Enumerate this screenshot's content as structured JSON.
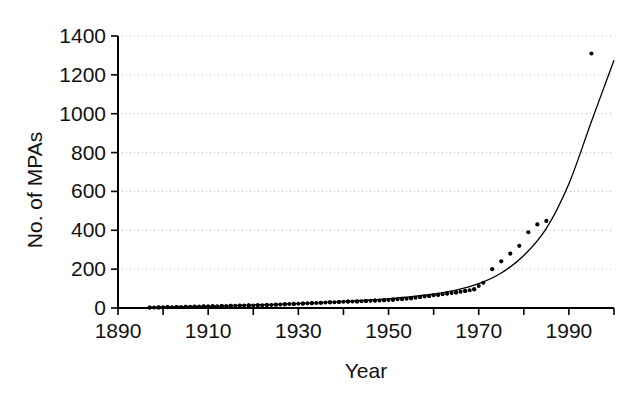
{
  "chart_data": {
    "type": "scatter",
    "title": "",
    "xlabel": "Year",
    "ylabel": "No. of MPAs",
    "xlim": [
      1890,
      2000
    ],
    "ylim": [
      0,
      1400
    ],
    "xticks": [
      1890,
      1900,
      1910,
      1920,
      1930,
      1940,
      1950,
      1960,
      1970,
      1980,
      1990,
      2000
    ],
    "xtick_labels": [
      "1890",
      "",
      "1910",
      "",
      "1930",
      "",
      "1950",
      "",
      "1970",
      "",
      "1990",
      ""
    ],
    "xtick_labels_shown": [
      "1890",
      "1910",
      "1930",
      "1950",
      "1970",
      "1990"
    ],
    "yticks": [
      0,
      200,
      400,
      600,
      800,
      1000,
      1200,
      1400
    ],
    "ytick_labels": [
      "0",
      "200",
      "400",
      "600",
      "800",
      "1000",
      "1200",
      "1400"
    ],
    "grid": "horizontal-dotted",
    "legend": null,
    "series": [
      {
        "name": "Cumulative number of MPAs",
        "marker": "filled-circle",
        "x": [
          1897,
          1899,
          1901,
          1903,
          1905,
          1907,
          1909,
          1911,
          1913,
          1915,
          1917,
          1919,
          1921,
          1923,
          1925,
          1927,
          1929,
          1931,
          1933,
          1935,
          1937,
          1939,
          1941,
          1943,
          1945,
          1947,
          1949,
          1951,
          1953,
          1955,
          1957,
          1959,
          1961,
          1963,
          1965,
          1967,
          1969,
          1971,
          1973,
          1975,
          1977,
          1979,
          1981,
          1983,
          1985,
          1995
        ],
        "y": [
          2,
          3,
          4,
          5,
          6,
          7,
          8,
          9,
          10,
          11,
          12,
          13,
          14,
          15,
          17,
          19,
          21,
          23,
          25,
          27,
          29,
          31,
          33,
          34,
          36,
          38,
          40,
          43,
          46,
          50,
          56,
          62,
          68,
          74,
          80,
          88,
          96,
          130,
          200,
          240,
          280,
          320,
          390,
          430,
          448,
          1310
        ]
      },
      {
        "name": "Fitted exponential curve",
        "marker": "line",
        "x": [
          1897,
          1905,
          1915,
          1925,
          1935,
          1945,
          1950,
          1955,
          1960,
          1965,
          1970,
          1975,
          1980,
          1985,
          1990,
          1995,
          2000
        ],
        "y": [
          4,
          7,
          12,
          19,
          28,
          40,
          48,
          58,
          72,
          92,
          125,
          180,
          270,
          410,
          640,
          960,
          1275
        ]
      }
    ],
    "annotations": [
      {
        "label": "outlier point",
        "x": 1995,
        "y": 1310
      }
    ],
    "colors": {
      "axis": "#000000",
      "grid": "#b4b4b4",
      "marker": "#000000",
      "curve": "#000000",
      "background": "#ffffff"
    }
  },
  "axes": {
    "y_axis_title": "No. of MPAs",
    "x_axis_title": "Year"
  }
}
